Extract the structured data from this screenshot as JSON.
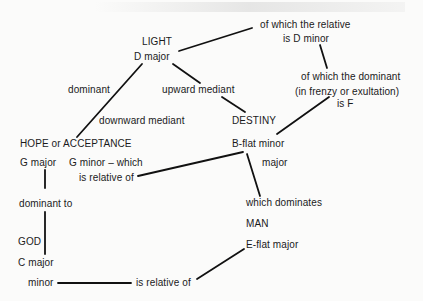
{
  "diagram": {
    "type": "key-relationship flow diagram",
    "nodes": {
      "light": {
        "title": "LIGHT",
        "key": "D  major"
      },
      "relative_note": {
        "line1": "of which the relative",
        "line2": "is D minor"
      },
      "dominant_note": {
        "line1": "of which the dominant",
        "line2": "(in frenzy or exultation)",
        "line3": "is F"
      },
      "dominant_label": "dominant",
      "upward_mediant": "upward mediant",
      "downward_mediant": "downward mediant",
      "destiny": {
        "title": "DESTINY",
        "key": "B-flat minor",
        "alt": "major"
      },
      "hope": {
        "title": "HOPE or ACCEPTANCE",
        "key": "G major"
      },
      "g_minor": {
        "line1": "G minor – which",
        "line2": "is relative of"
      },
      "dominant_to": "dominant  to",
      "which_dominates": "which dominates",
      "man": {
        "title": "MAN",
        "key": "E-flat major"
      },
      "god": {
        "title": "GOD",
        "key": "C major"
      },
      "minor": "minor",
      "is_relative_of": "is relative of"
    },
    "edges": [
      {
        "from": "LIGHT D major",
        "to": "of which the relative is D minor"
      },
      {
        "from": "is D minor",
        "to": "of which the dominant"
      },
      {
        "from": "D major",
        "to": "HOPE or ACCEPTANCE",
        "label": "dominant / downward mediant"
      },
      {
        "from": "D major",
        "to": "upward mediant"
      },
      {
        "from": "upward mediant",
        "to": "DESTINY"
      },
      {
        "from": "is F",
        "to": "B-flat minor"
      },
      {
        "from": "B-flat minor",
        "to": "G minor – which is relative of"
      },
      {
        "from": "B-flat minor",
        "to": "which dominates"
      },
      {
        "from": "G major",
        "to": "dominant to"
      },
      {
        "from": "dominant to",
        "to": "GOD C major"
      },
      {
        "from": "minor",
        "to": "is relative of"
      },
      {
        "from": "is relative of",
        "to": "E-flat major"
      }
    ]
  }
}
